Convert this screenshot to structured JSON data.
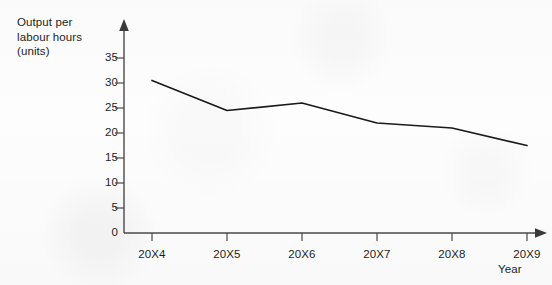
{
  "chart_data": {
    "type": "line",
    "title": "",
    "subtitle": "",
    "xlabel": "Year",
    "ylabel": "Output per\nlabour hours\n(units)",
    "categories": [
      "20X4",
      "20X5",
      "20X6",
      "20X7",
      "20X8",
      "20X9"
    ],
    "values": [
      30.5,
      24.5,
      26.0,
      22.0,
      21.0,
      17.5
    ],
    "series": [
      {
        "name": "Output per labour hours (units)",
        "values": [
          30.5,
          24.5,
          26.0,
          22.0,
          21.0,
          17.5
        ]
      }
    ],
    "ylim": [
      0,
      38
    ],
    "xlim": [
      0,
      6
    ],
    "y_ticks": [
      0,
      5,
      10,
      15,
      20,
      25,
      30,
      35
    ],
    "y_tick_labels": [
      "0",
      "5",
      "10",
      "15",
      "20",
      "25",
      "30",
      "35"
    ],
    "x_tick_labels": [
      "20X4",
      "20X5",
      "20X6",
      "20X7",
      "20X8",
      "20X9"
    ],
    "grid": false,
    "legend": false,
    "legend_position": "none",
    "markers": false,
    "line_color": "#1a1a1a",
    "axis_color": "#4a4a4a",
    "text_color": "#1d1d1d",
    "axis_arrows": {
      "x_axis_arrow": true,
      "y_axis_arrow": true
    },
    "annotations": []
  },
  "geometry": {
    "y_axis_x": 124,
    "x_axis_y": 233,
    "y_pixels_per_unit": 5,
    "x_positions": [
      152,
      227,
      302,
      377,
      452,
      527
    ],
    "y_tick_pixels": [
      233,
      208,
      183,
      158,
      133,
      108,
      83,
      58
    ]
  }
}
